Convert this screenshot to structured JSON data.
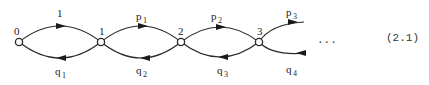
{
  "diagram": {
    "type": "birth-death chain",
    "nodes": [
      {
        "id": "n0",
        "label": "0"
      },
      {
        "id": "n1",
        "label": "1"
      },
      {
        "id": "n2",
        "label": "2"
      },
      {
        "id": "n3",
        "label": "3"
      }
    ],
    "forward_edges": [
      {
        "from": "0",
        "to": "1",
        "label": "1",
        "sub": ""
      },
      {
        "from": "1",
        "to": "2",
        "label": "p",
        "sub": "1"
      },
      {
        "from": "2",
        "to": "3",
        "label": "p",
        "sub": "2"
      },
      {
        "from": "3",
        "to": "…",
        "label": "p",
        "sub": "3"
      }
    ],
    "backward_edges": [
      {
        "from": "1",
        "to": "0",
        "label": "q",
        "sub": "1"
      },
      {
        "from": "2",
        "to": "1",
        "label": "q",
        "sub": "2"
      },
      {
        "from": "3",
        "to": "2",
        "label": "q",
        "sub": "3"
      },
      {
        "from": "…",
        "to": "3",
        "label": "q",
        "sub": "4"
      }
    ],
    "continuation": "...",
    "equation_number": "(2.1)"
  }
}
